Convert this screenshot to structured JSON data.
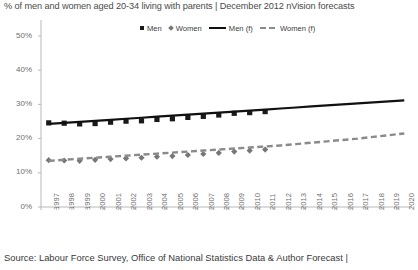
{
  "title": "% of men and women aged 20-34 living with parents | December 2012 nVision forecasts",
  "footer": "Source: Labour Force Survey, Office of National Statistics Data & Author Forecast |",
  "legend": {
    "position": "top-center",
    "items": [
      {
        "label": "Men",
        "marker": "square-marker-icon",
        "color": "#1a1a1a"
      },
      {
        "label": "Women",
        "marker": "diamond-marker-icon",
        "color": "#777777"
      },
      {
        "label": "Men (f)",
        "marker": "solid-line-icon",
        "color": "#111111"
      },
      {
        "label": "Women (f)",
        "marker": "dashed-line-icon",
        "color": "#8a8a8a"
      }
    ]
  },
  "chart_data": {
    "type": "line",
    "title": "% of men and women aged 20-34 living with parents | December 2012 nVision forecasts",
    "xlabel": "",
    "ylabel": "",
    "ylim": [
      0,
      50
    ],
    "yticks": [
      "0%",
      "10%",
      "20%",
      "30%",
      "40%",
      "50%"
    ],
    "ytick_values": [
      0,
      10,
      20,
      30,
      40,
      50
    ],
    "grid": false,
    "categories": [
      "1997",
      "1998",
      "1999",
      "2000",
      "2001",
      "2002",
      "2003",
      "2004",
      "2005",
      "2006",
      "2007",
      "2008",
      "2009",
      "2010",
      "2011",
      "2012",
      "2013",
      "2014",
      "2015",
      "2016",
      "2017",
      "2018",
      "2019",
      "2020"
    ],
    "series": [
      {
        "name": "Men",
        "type": "scatter",
        "color": "#1a1a1a",
        "marker": "square",
        "values": [
          24.6,
          24.5,
          24.3,
          24.4,
          24.8,
          25.1,
          25.2,
          25.6,
          25.8,
          26.2,
          26.5,
          26.9,
          27.4,
          27.6,
          27.9,
          null,
          null,
          null,
          null,
          null,
          null,
          null,
          null,
          null
        ]
      },
      {
        "name": "Women",
        "type": "scatter",
        "color": "#777777",
        "marker": "diamond",
        "values": [
          13.7,
          13.6,
          13.5,
          13.8,
          14.0,
          14.2,
          14.4,
          14.7,
          14.9,
          15.2,
          15.5,
          15.8,
          16.2,
          16.5,
          16.8,
          null,
          null,
          null,
          null,
          null,
          null,
          null,
          null,
          null
        ]
      },
      {
        "name": "Men (f)",
        "type": "line",
        "style": "solid",
        "color": "#111111",
        "values": [
          24.3,
          24.6,
          24.9,
          25.2,
          25.5,
          25.8,
          26.1,
          26.4,
          26.7,
          27.0,
          27.3,
          27.6,
          27.9,
          28.2,
          28.5,
          28.8,
          29.1,
          29.4,
          29.7,
          30.0,
          30.3,
          30.6,
          30.9,
          31.2
        ]
      },
      {
        "name": "Women (f)",
        "type": "line",
        "style": "dashed",
        "color": "#8a8a8a",
        "values": [
          13.5,
          13.8,
          14.1,
          14.4,
          14.7,
          15.0,
          15.3,
          15.6,
          15.9,
          16.2,
          16.5,
          16.8,
          17.1,
          17.4,
          17.7,
          18.0,
          18.4,
          18.8,
          19.2,
          19.6,
          20.0,
          20.5,
          21.0,
          21.5
        ]
      }
    ]
  }
}
